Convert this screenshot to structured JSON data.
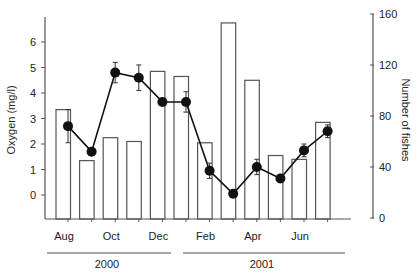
{
  "chart_data": {
    "type": "bar+line",
    "title": "",
    "xlabel": "",
    "categories": [
      "Aug",
      "Sep",
      "Oct",
      "Nov",
      "Dec",
      "Jan",
      "Feb",
      "Mar",
      "Apr",
      "May",
      "Jun",
      "Jul"
    ],
    "x_tick_labels": [
      {
        "index": 0,
        "label": "Aug"
      },
      {
        "index": 2,
        "label": "Oct"
      },
      {
        "index": 4,
        "label": "Dec"
      },
      {
        "index": 6,
        "label": "Feb"
      },
      {
        "index": 8,
        "label": "Apr"
      },
      {
        "index": 10,
        "label": "Jun"
      }
    ],
    "year_groups": [
      {
        "label": "2000",
        "from_index": 0,
        "to_index": 4
      },
      {
        "label": "2001",
        "from_index": 5,
        "to_index": 11
      }
    ],
    "left_axis": {
      "label": "Oxygen (mg/l)",
      "ticks": [
        0,
        1,
        2,
        3,
        4,
        5,
        6
      ],
      "range": [
        -1.1,
        6.9
      ]
    },
    "right_axis": {
      "label": "Number of fishes",
      "ticks": [
        0,
        40,
        80,
        120,
        160
      ],
      "range": [
        0,
        160
      ]
    },
    "series": [
      {
        "name": "Number of fishes",
        "type": "bar",
        "axis": "right",
        "values": [
          85,
          45,
          63,
          60,
          115,
          111,
          59,
          153,
          108,
          49,
          46,
          75
        ]
      },
      {
        "name": "Oxygen",
        "type": "line",
        "axis": "left",
        "marker": "circle-filled",
        "values": [
          2.7,
          1.7,
          4.8,
          4.6,
          3.65,
          3.65,
          0.95,
          0.05,
          1.1,
          0.65,
          1.75,
          2.5
        ],
        "error": [
          0.65,
          0.1,
          0.4,
          0.5,
          0.1,
          0.4,
          0.3,
          0.05,
          0.3,
          0.15,
          0.25,
          0.25
        ]
      }
    ],
    "grid": false,
    "legend": null
  }
}
